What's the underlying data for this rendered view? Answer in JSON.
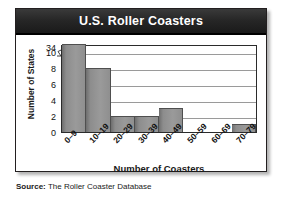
{
  "figure": {
    "title": "U.S. Roller Coasters",
    "source_label": "Source:",
    "source_text": " The Roller Coaster Database"
  },
  "chart_data": {
    "type": "bar",
    "title": "U.S. Roller Coasters",
    "xlabel": "Number of Coasters",
    "ylabel": "Number of States",
    "categories": [
      "0–9",
      "10–19",
      "20–29",
      "30–39",
      "40–49",
      "50–59",
      "60–69",
      "70–79"
    ],
    "values": [
      34,
      8,
      2,
      2,
      3,
      0,
      0,
      1
    ],
    "ytick_labels": [
      "34",
      "10",
      "8",
      "6",
      "4",
      "2",
      "0"
    ],
    "ytick_values": [
      34,
      10,
      8,
      6,
      4,
      2,
      0
    ],
    "ylim": [
      0,
      11
    ],
    "y_axis_break": true,
    "y_axis_break_between": [
      10,
      34
    ],
    "grid": true,
    "grid_axis": "y",
    "legend": "none",
    "bar_color": "#9a9a9a",
    "title_bar_color": "#1f1f1f",
    "title_text_color": "#ffffff",
    "plot_background": "#ffffff"
  }
}
